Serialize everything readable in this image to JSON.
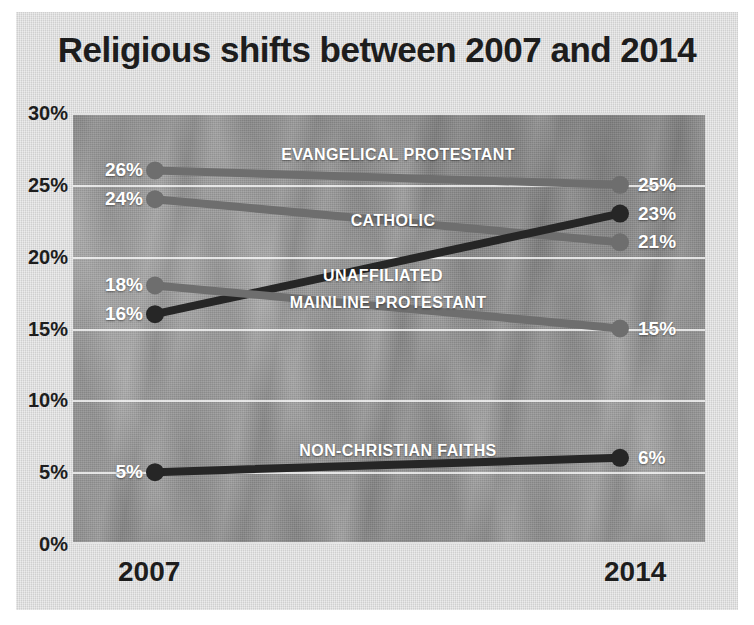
{
  "title": "Religious shifts between 2007 and 2014",
  "axis": {
    "y_ticks": [
      "30%",
      "25%",
      "20%",
      "15%",
      "10%",
      "5%",
      "0%"
    ],
    "x_ticks": [
      "2007",
      "2014"
    ]
  },
  "colors": {
    "card_background": "#dcdcdc",
    "plot_background": "#9a9a9a",
    "title_text": "#1d1d1d",
    "gridline": "#ffffff",
    "label_text": "#ffffff",
    "line_light": "#6e6e6e",
    "line_dark": "#262626"
  },
  "chart_data": {
    "type": "line",
    "title": "Religious shifts between 2007 and 2014",
    "xlabel": "",
    "ylabel": "",
    "x": [
      "2007",
      "2014"
    ],
    "ylim": [
      0,
      30
    ],
    "yticks": [
      0,
      5,
      10,
      15,
      20,
      25,
      30
    ],
    "grid": true,
    "legend": "inline-labels",
    "series": [
      {
        "name": "EVANGELICAL PROTESTANT",
        "values": [
          26,
          25
        ],
        "labels": [
          "26%",
          "25%"
        ],
        "color": "#6e6e6e"
      },
      {
        "name": "CATHOLIC",
        "values": [
          24,
          21
        ],
        "labels": [
          "24%",
          "21%"
        ],
        "color": "#6e6e6e"
      },
      {
        "name": "UNAFFILIATED",
        "values": [
          16,
          23
        ],
        "labels": [
          "16%",
          "23%"
        ],
        "color": "#262626"
      },
      {
        "name": "MAINLINE PROTESTANT",
        "values": [
          18,
          15
        ],
        "labels": [
          "18%",
          "15%"
        ],
        "color": "#6e6e6e"
      },
      {
        "name": "NON-CHRISTIAN FAITHS",
        "values": [
          5,
          6
        ],
        "labels": [
          "5%",
          "6%"
        ],
        "color": "#262626"
      }
    ]
  }
}
